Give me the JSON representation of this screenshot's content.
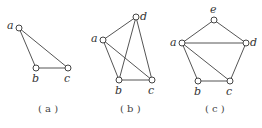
{
  "diagrams": [
    {
      "caption": "( a )",
      "nodes": [
        {
          "id": "a",
          "label": "a",
          "x": 19,
          "y": 28,
          "lx": 7,
          "ly": 29
        },
        {
          "id": "b",
          "label": "b",
          "x": 36,
          "y": 68,
          "lx": 32,
          "ly": 82
        },
        {
          "id": "c",
          "label": "c",
          "x": 68,
          "y": 68,
          "lx": 64,
          "ly": 82
        }
      ],
      "edges": [
        [
          "a",
          "b"
        ],
        [
          "a",
          "c"
        ],
        [
          "b",
          "c"
        ]
      ],
      "caption_x": 38,
      "caption_y": 112
    },
    {
      "caption": "( b )",
      "nodes": [
        {
          "id": "a",
          "label": "a",
          "x": 103,
          "y": 40,
          "lx": 91,
          "ly": 42
        },
        {
          "id": "d",
          "label": "d",
          "x": 136,
          "y": 17,
          "lx": 140,
          "ly": 20
        },
        {
          "id": "b",
          "label": "b",
          "x": 119,
          "y": 80,
          "lx": 115,
          "ly": 94
        },
        {
          "id": "c",
          "label": "c",
          "x": 152,
          "y": 80,
          "lx": 148,
          "ly": 94
        }
      ],
      "edges": [
        [
          "a",
          "d"
        ],
        [
          "a",
          "b"
        ],
        [
          "a",
          "c"
        ],
        [
          "b",
          "c"
        ],
        [
          "b",
          "d"
        ],
        [
          "d",
          "c"
        ]
      ],
      "caption_x": 120,
      "caption_y": 112
    },
    {
      "caption": "( c )",
      "nodes": [
        {
          "id": "e",
          "label": "e",
          "x": 214,
          "y": 20,
          "lx": 210,
          "ly": 13
        },
        {
          "id": "a",
          "label": "a",
          "x": 182,
          "y": 43,
          "lx": 170,
          "ly": 46
        },
        {
          "id": "d",
          "label": "d",
          "x": 246,
          "y": 43,
          "lx": 250,
          "ly": 46
        },
        {
          "id": "b",
          "label": "b",
          "x": 198,
          "y": 81,
          "lx": 194,
          "ly": 95
        },
        {
          "id": "c",
          "label": "c",
          "x": 230,
          "y": 81,
          "lx": 226,
          "ly": 95
        }
      ],
      "edges": [
        [
          "a",
          "e"
        ],
        [
          "e",
          "d"
        ],
        [
          "a",
          "d"
        ],
        [
          "a",
          "b"
        ],
        [
          "a",
          "c"
        ],
        [
          "b",
          "c"
        ],
        [
          "d",
          "c"
        ]
      ],
      "caption_x": 205,
      "caption_y": 112
    }
  ]
}
